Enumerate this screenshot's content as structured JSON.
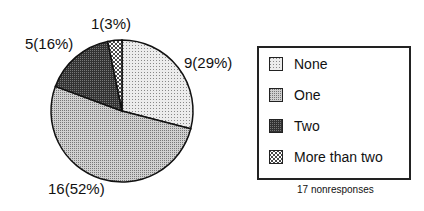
{
  "chart_data": {
    "type": "pie",
    "title": "",
    "categories": [
      "None",
      "One",
      "Two",
      "More than two"
    ],
    "values": [
      9,
      16,
      5,
      1
    ],
    "percentages": [
      29,
      52,
      16,
      3
    ],
    "slice_labels": [
      "9(29%)",
      "16(52%)",
      "5(16%)",
      "1(3%)"
    ],
    "start_angle": "12 o'clock",
    "direction": "clockwise",
    "legend": {
      "position": "right",
      "entries": [
        "None",
        "One",
        "Two",
        "More than two"
      ]
    },
    "annotations": [
      "17 nonresponses"
    ],
    "fills": [
      "#d8d8d8",
      "#bdbdbd",
      "#444444",
      "crosshatch"
    ]
  },
  "labels": {
    "none": "9(29%)",
    "one": "16(52%)",
    "two": "5(16%)",
    "more": "1(3%)"
  },
  "legend": {
    "items": [
      "None",
      "One",
      "Two",
      "More than two"
    ]
  },
  "note": "17 nonresponses"
}
